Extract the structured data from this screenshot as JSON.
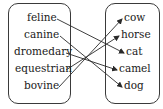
{
  "diagram": {
    "type": "matching",
    "left_column": {
      "items": [
        {
          "label": "feline"
        },
        {
          "label": "canine"
        },
        {
          "label": "dromedary"
        },
        {
          "label": "equestrian"
        },
        {
          "label": "bovine"
        }
      ]
    },
    "right_column": {
      "items": [
        {
          "label": "cow"
        },
        {
          "label": "horse"
        },
        {
          "label": "cat"
        },
        {
          "label": "camel"
        },
        {
          "label": "dog"
        }
      ]
    },
    "mappings": [
      {
        "from": "feline",
        "to": "cat"
      },
      {
        "from": "canine",
        "to": "dog"
      },
      {
        "from": "dromedary",
        "to": "camel"
      },
      {
        "from": "equestrian",
        "to": "horse"
      },
      {
        "from": "bovine",
        "to": "cow"
      }
    ],
    "colors": {
      "line": "#2a2a2a",
      "text": "#1a1a1a",
      "border": "#3a3a3a"
    }
  }
}
